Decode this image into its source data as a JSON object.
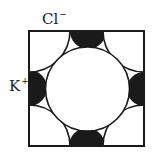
{
  "diagram": {
    "type": "crystal-lattice-face",
    "labels": {
      "anion": {
        "symbol": "Cl",
        "charge": "−"
      },
      "cation": {
        "symbol": "K",
        "charge": "+"
      }
    },
    "colors": {
      "stroke": "#1a1a1a",
      "cation_fill": "#1a1a1a",
      "anion_fill": "#ffffff",
      "background": "#ffffff"
    },
    "unit_cell": {
      "x": 29,
      "y": 31,
      "size": 115
    },
    "anion_center": {
      "cx": 87.5,
      "cy": 89,
      "r": 42
    },
    "anion_corner_radius": 41,
    "cation_half_radius": 18
  }
}
